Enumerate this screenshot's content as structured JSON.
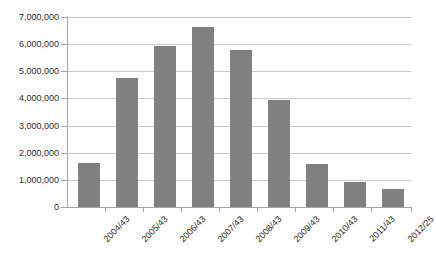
{
  "chart_data": {
    "type": "bar",
    "title": "",
    "subtitle": "",
    "xlabel": "",
    "ylabel": "",
    "categories": [
      "2004/43",
      "2005/43",
      "2006/43",
      "2007/43",
      "2008/43",
      "2009/43",
      "2010/43",
      "2011/43",
      "2012/25"
    ],
    "values": [
      1620000,
      4750000,
      5950000,
      6650000,
      5800000,
      3950000,
      1580000,
      930000,
      680000
    ],
    "series": [
      {
        "name": "",
        "values": [
          1620000,
          4750000,
          5950000,
          6650000,
          5800000,
          3950000,
          1580000,
          930000,
          680000
        ]
      }
    ],
    "ylim": [
      0,
      7000000
    ],
    "ytick_values": [
      0,
      1000000,
      2000000,
      3000000,
      4000000,
      5000000,
      6000000,
      7000000
    ],
    "ytick_labels": [
      "0",
      "1,000,000",
      "2,000,000",
      "3,000,000",
      "4,000,000",
      "5,000,000",
      "6,000,000",
      "7,000,000"
    ],
    "grid": true,
    "grid_axis": "y",
    "legend": false,
    "legend_position": "none",
    "bar_color": "#808080",
    "gridline_color": "#c9c9c9",
    "axis_color": "#a6a6a6",
    "background_color": "#ffffff",
    "xtick_label_rotation": -45
  }
}
